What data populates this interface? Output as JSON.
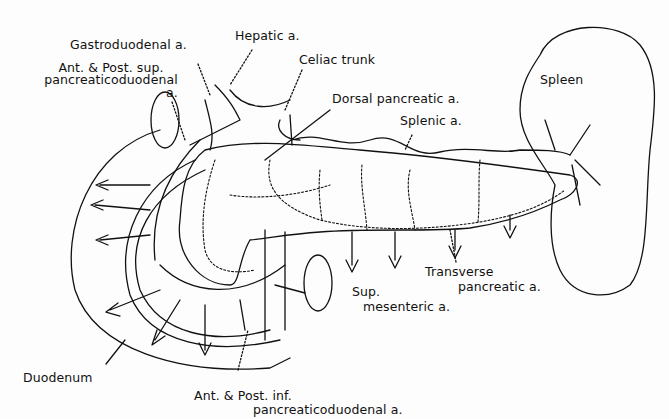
{
  "diagram": {
    "style": "black line drawing on white",
    "colors": {
      "ink": "#111111",
      "background": "#fdfdfd"
    },
    "labels": {
      "gastroduodenal": "Gastroduodenal a.",
      "hepatic": "Hepatic a.",
      "celiac": "Celiac trunk",
      "ant_post_sup_1": "Ant. & Post. sup.",
      "ant_post_sup_2": "pancreaticoduodenal",
      "ant_post_sup_3": "a.",
      "dorsal_pancreatic": "Dorsal pancreatic a.",
      "splenic": "Splenic a.",
      "spleen": "Spleen",
      "transverse_1": "Transverse",
      "transverse_2": "pancreatic a.",
      "sup_mesenteric_1": "Sup.",
      "sup_mesenteric_2": "mesenteric a.",
      "duodenum": "Duodenum",
      "ant_post_inf_1": "Ant. & Post. inf.",
      "ant_post_inf_2": "pancreaticoduodenal a."
    }
  }
}
